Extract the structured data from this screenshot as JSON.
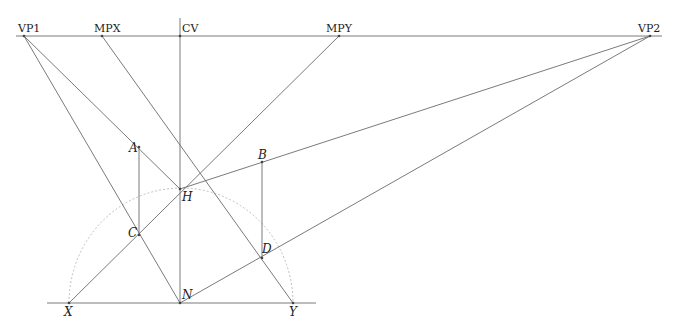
{
  "diagram": {
    "horizon_labels": {
      "vp1": "VP1",
      "mpx": "MPX",
      "cv": "CV",
      "mpy": "MPY",
      "vp2": "VP2"
    },
    "point_labels": {
      "a": "A",
      "b": "B",
      "c": "C",
      "d": "D",
      "h": "H",
      "n": "N",
      "x": "X",
      "y": "Y"
    },
    "colors": {
      "line": "#6b6b6b",
      "arc": "#b8b8b8",
      "text": "#222222"
    }
  }
}
